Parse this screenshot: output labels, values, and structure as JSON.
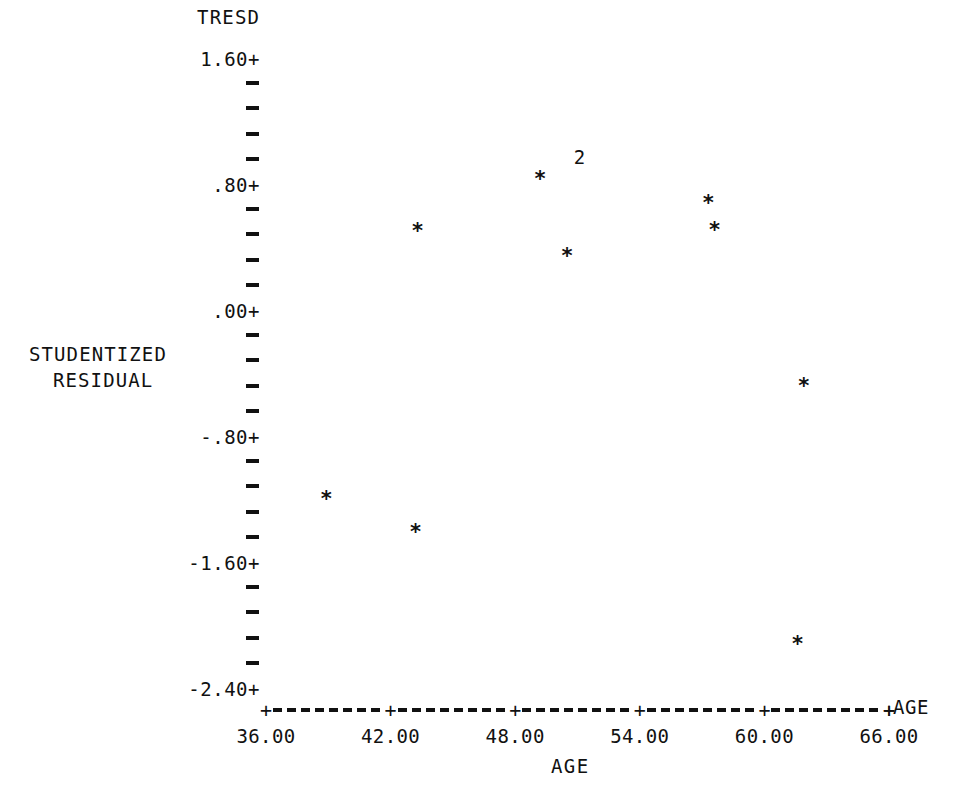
{
  "chart_data": {
    "type": "scatter",
    "title": "TRESD",
    "xlabel": "AGE",
    "ylabel": "STUDENTIZED RESIDUAL",
    "axis_end_label": "AGE",
    "xlim": [
      36.0,
      67.5
    ],
    "ylim": [
      -2.4,
      1.6
    ],
    "grid": false,
    "legend": null,
    "x_ticks": [
      {
        "value": 36.0,
        "label": "36.00"
      },
      {
        "value": 42.0,
        "label": "42.00"
      },
      {
        "value": 48.0,
        "label": "48.00"
      },
      {
        "value": 54.0,
        "label": "54.00"
      },
      {
        "value": 60.0,
        "label": "60.00"
      },
      {
        "value": 66.0,
        "label": "66.00"
      }
    ],
    "y_ticks": [
      {
        "value": 1.6,
        "label": "1.60+",
        "major": true
      },
      {
        "value": 1.44,
        "label": "-",
        "major": false
      },
      {
        "value": 1.28,
        "label": "-",
        "major": false
      },
      {
        "value": 1.12,
        "label": "-",
        "major": false
      },
      {
        "value": 0.96,
        "label": "-",
        "major": false
      },
      {
        "value": 0.8,
        "label": ".80+",
        "major": true
      },
      {
        "value": 0.64,
        "label": "-",
        "major": false
      },
      {
        "value": 0.48,
        "label": "-",
        "major": false
      },
      {
        "value": 0.32,
        "label": "-",
        "major": false
      },
      {
        "value": 0.16,
        "label": "-",
        "major": false
      },
      {
        "value": 0.0,
        "label": ".00+",
        "major": true
      },
      {
        "value": -0.16,
        "label": "-",
        "major": false
      },
      {
        "value": -0.32,
        "label": "-",
        "major": false
      },
      {
        "value": -0.48,
        "label": "-",
        "major": false
      },
      {
        "value": -0.64,
        "label": "-",
        "major": false
      },
      {
        "value": -0.8,
        "label": "-.80+",
        "major": true
      },
      {
        "value": -0.96,
        "label": "-",
        "major": false
      },
      {
        "value": -1.12,
        "label": "-",
        "major": false
      },
      {
        "value": -1.28,
        "label": "-",
        "major": false
      },
      {
        "value": -1.44,
        "label": "-",
        "major": false
      },
      {
        "value": -1.6,
        "label": "-1.60+",
        "major": true
      },
      {
        "value": -1.76,
        "label": "-",
        "major": false
      },
      {
        "value": -1.92,
        "label": "-",
        "major": false
      },
      {
        "value": -2.08,
        "label": "-",
        "major": false
      },
      {
        "value": -2.24,
        "label": "-",
        "major": false
      },
      {
        "value": -2.4,
        "label": "-2.40+",
        "major": true
      }
    ],
    "marker_glyph": "*",
    "points": [
      {
        "x": 49.2,
        "y": 0.83,
        "glyph": "*",
        "count": 1
      },
      {
        "x": 43.3,
        "y": 0.5,
        "glyph": "*",
        "count": 1
      },
      {
        "x": 50.5,
        "y": 0.34,
        "glyph": "*",
        "count": 1
      },
      {
        "x": 57.3,
        "y": 0.68,
        "glyph": "*",
        "count": 1
      },
      {
        "x": 57.6,
        "y": 0.51,
        "glyph": "*",
        "count": 1
      },
      {
        "x": 61.9,
        "y": -0.48,
        "glyph": "*",
        "count": 1
      },
      {
        "x": 38.9,
        "y": -1.2,
        "glyph": "*",
        "count": 1
      },
      {
        "x": 43.2,
        "y": -1.41,
        "glyph": "*",
        "count": 1
      },
      {
        "x": 61.6,
        "y": -2.12,
        "glyph": "*",
        "count": 1
      }
    ],
    "overlap_markers": [
      {
        "x": 51.1,
        "y": 0.97,
        "label": "2",
        "count": 2
      }
    ]
  },
  "render": {
    "plot_left_px": 266,
    "plot_right_px": 889,
    "axis_y_px": 708,
    "y_top_px": 58,
    "y_bottom_px": 688,
    "ytick_column_px": 246,
    "colors": {
      "ink": "#111111",
      "paper": "#ffffff"
    }
  }
}
